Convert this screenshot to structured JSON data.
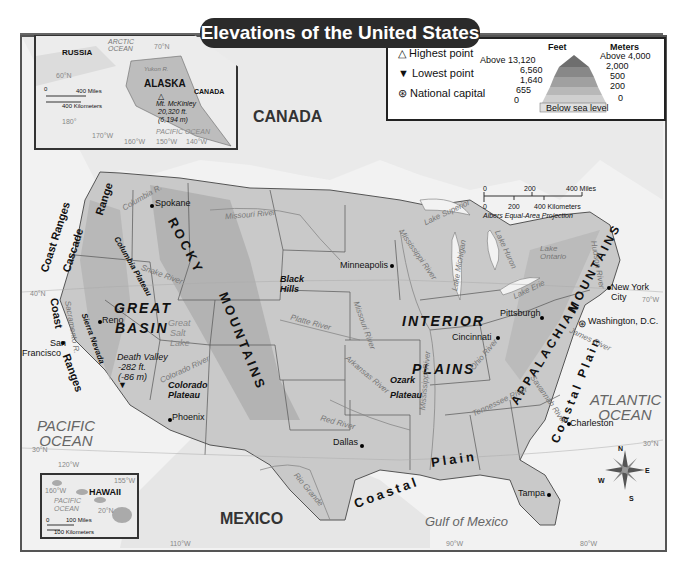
{
  "title": "Elevations of the United States",
  "legend": {
    "symbols": [
      {
        "icon": "highest-point-triangle-icon",
        "glyph": "△",
        "label": "Highest point"
      },
      {
        "icon": "lowest-point-triangle-icon",
        "glyph": "▼",
        "label": "Lowest point"
      },
      {
        "icon": "national-capital-star-icon",
        "glyph": "⊛",
        "label": "National capital"
      }
    ],
    "feet_header": "Feet",
    "meters_header": "Meters",
    "feet_levels": [
      "Above 13,120",
      "6,560",
      "1,640",
      "655",
      "0"
    ],
    "meter_levels": [
      "Above 4,000",
      "2,000",
      "500",
      "200",
      "0"
    ],
    "below_sea_level": "Below sea level"
  },
  "scale_bar": {
    "miles": [
      "0",
      "200",
      "400 Miles"
    ],
    "kilometers": [
      "0",
      "200",
      "400 Kilometers"
    ],
    "projection": "Albers Equal-Area Projection"
  },
  "alaska_inset": {
    "labels": {
      "russia": "RUSSIA",
      "arctic": "ARCTIC OCEAN",
      "lat70": "70°N",
      "lat60": "60°N",
      "alaska": "ALASKA",
      "canada": "CANADA",
      "yukon": "Yukon R.",
      "mckinley1": "Mt. McKinley",
      "mckinley2": "20,320 ft.",
      "mckinley3": "(6,194 m)",
      "pacific": "PACIFIC OCEAN",
      "lon180": "180°",
      "lon170": "170°W",
      "lon160": "160°W",
      "lon150": "150°W",
      "lon140": "140°W"
    },
    "scale_miles": "400 Miles",
    "scale_km": "400 Kilometers",
    "scale_zero": "0"
  },
  "hawaii_inset": {
    "labels": {
      "hawaii": "HAWAII",
      "lon155": "155°W",
      "lon160": "160°W",
      "pacific": "PACIFIC OCEAN",
      "lat20": "20°N"
    },
    "scale_miles": "100 Miles",
    "scale_km": "100 Kilometers",
    "scale_zero": "0"
  },
  "countries": {
    "canada": "CANADA",
    "mexico": "MEXICO"
  },
  "water": {
    "pacific": "PACIFIC OCEAN",
    "atlantic": "ATLANTIC OCEAN",
    "gulf": "Gulf of Mexico"
  },
  "regions": {
    "rocky": "ROCKY",
    "mountains": "MOUNTAINS",
    "great": "GREAT",
    "basin": "BASIN",
    "interior": "INTERIOR",
    "plains": "PLAINS",
    "appalachian": "APPALACHIAN",
    "app_mountains": "MOUNTAINS",
    "coastal": "Coastal",
    "plain": "Plain",
    "coastal_plain": "Coastal Plain",
    "coast_ranges_n": "Coast Ranges",
    "coast_ranges_s1": "Coast",
    "coast_ranges_s2": "Ranges",
    "cascade": "Cascade",
    "range": "Range",
    "sierra": "Sierra Nevada",
    "columbia_plateau": "Columbia Plateau",
    "colorado_plateau1": "Colorado",
    "colorado_plateau2": "Plateau",
    "ozark1": "Ozark",
    "ozark2": "Plateau",
    "black_hills1": "Black",
    "black_hills2": "Hills",
    "great_salt_lake1": "Great",
    "great_salt_lake2": "Salt",
    "great_salt_lake3": "Lake",
    "death_valley1": "Death Valley",
    "death_valley2": "-282 ft.",
    "death_valley3": "(-86 m)"
  },
  "rivers": {
    "columbia": "Columbia R.",
    "snake": "Snake River",
    "missouri_n": "Missouri River",
    "missouri_s": "Missouri River",
    "platte": "Platte River",
    "colorado": "Colorado River",
    "sacramento": "Sacramento R.",
    "mississippi": "Mississippi River",
    "mississippi_s": "Mississippi River",
    "arkansas": "Arkansas River",
    "red": "Red River",
    "rio_grande": "Rio Grande",
    "ohio": "Ohio River",
    "tennessee": "Tennessee River",
    "savannah": "Savannah River",
    "james": "James River",
    "hudson": "Hudson River"
  },
  "lakes": {
    "superior": "Lake Superior",
    "michigan": "Lake Michigan",
    "huron": "Lake Huron",
    "erie": "Lake Erie",
    "ontario": "Lake Ontario"
  },
  "cities": {
    "spokane": "Spokane",
    "reno": "Reno",
    "sf1": "San",
    "sf2": "Francisco",
    "phoenix": "Phoenix",
    "dallas": "Dallas",
    "minneapolis": "Minneapolis",
    "cincinnati": "Cincinnati",
    "pittsburgh": "Pittsburgh",
    "nyc1": "New York",
    "nyc2": "City",
    "washington": "Washington, D.C.",
    "charleston": "Charleston",
    "tampa": "Tampa"
  },
  "graticule": {
    "lat40w": "40°N",
    "lat30w": "30°N",
    "lat30e": "30°N",
    "lon120": "120°W",
    "lon110": "110°W",
    "lon90": "90°W",
    "lon80": "80°W",
    "lon70": "70°W"
  },
  "compass": {
    "n": "N",
    "s": "S",
    "e": "E",
    "w": "W"
  }
}
